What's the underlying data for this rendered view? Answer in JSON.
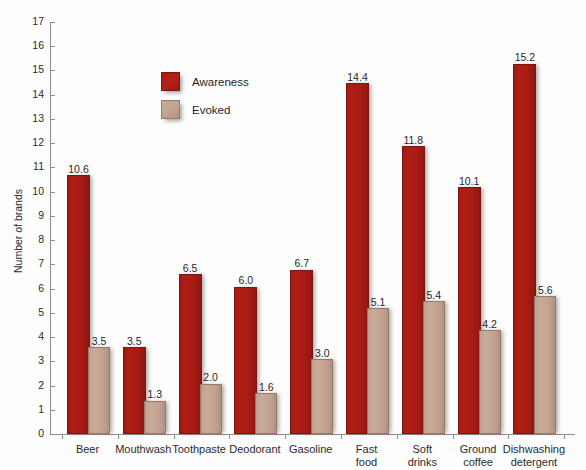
{
  "chart_data": {
    "type": "bar",
    "title": "",
    "xlabel": "",
    "ylabel": "Number of brands",
    "ylim": [
      0,
      17
    ],
    "ytick_step": 1,
    "yticks": [
      0,
      1,
      2,
      3,
      4,
      5,
      6,
      7,
      8,
      9,
      10,
      11,
      12,
      13,
      14,
      15,
      16,
      17
    ],
    "grid": false,
    "legend_position": "upper-left-inside",
    "categories": [
      "Beer",
      "Mouthwash",
      "Toothpaste",
      "Deodorant",
      "Gasoline",
      "Fast\nfood",
      "Soft\ndrinks",
      "Ground\ncoffee",
      "Dishwashing\ndetergent"
    ],
    "series": [
      {
        "name": "Awareness",
        "color": "#a81c13",
        "values": [
          10.6,
          3.5,
          6.5,
          6.0,
          6.7,
          14.4,
          11.8,
          10.1,
          15.2
        ],
        "labels": [
          "10.6",
          "3.5",
          "6.5",
          "6.0",
          "6.7",
          "14.4",
          "11.8",
          "10.1",
          "15.2"
        ]
      },
      {
        "name": "Evoked",
        "color": "#c2a392",
        "values": [
          3.5,
          1.3,
          2.0,
          1.6,
          3.0,
          5.1,
          5.4,
          4.2,
          5.6
        ],
        "labels": [
          "3.5",
          "1.3",
          "2.0",
          "1.6",
          "3.0",
          "5.1",
          "5.4",
          "4.2",
          "5.6"
        ]
      }
    ]
  }
}
